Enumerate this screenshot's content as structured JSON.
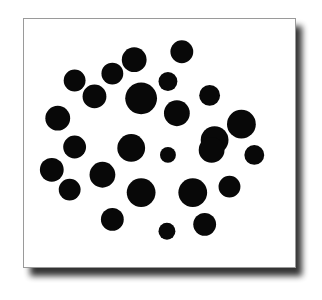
{
  "figure": {
    "title": "",
    "caption": "",
    "background_color": "#ffffff",
    "frame": {
      "border_color": "#9a9a9a",
      "fill_color": "#ffffff",
      "shadow_color": "#000000",
      "x": 23,
      "y": 18,
      "width": 273,
      "height": 250
    }
  },
  "chart_data": {
    "type": "scatter",
    "title": "",
    "xlabel": "",
    "ylabel": "",
    "grid": false,
    "legend": "none",
    "marker": "filled-circle",
    "marker_color": "#080808",
    "xlim": [
      23,
      296
    ],
    "ylim": [
      18,
      268
    ],
    "point_count": 29,
    "series": [
      {
        "name": "points",
        "color": "#080808",
        "points": [
          {
            "x": 134,
            "y": 59,
            "r": 12.5
          },
          {
            "x": 182,
            "y": 51,
            "r": 11.5
          },
          {
            "x": 112,
            "y": 73,
            "r": 11.0
          },
          {
            "x": 74,
            "y": 80,
            "r": 11.0
          },
          {
            "x": 168,
            "y": 81,
            "r": 9.5
          },
          {
            "x": 94,
            "y": 96,
            "r": 12.0
          },
          {
            "x": 141,
            "y": 98,
            "r": 16.0
          },
          {
            "x": 210,
            "y": 95,
            "r": 10.5
          },
          {
            "x": 57,
            "y": 118,
            "r": 12.5
          },
          {
            "x": 177,
            "y": 113,
            "r": 13.0
          },
          {
            "x": 242,
            "y": 124,
            "r": 14.5
          },
          {
            "x": 74,
            "y": 147,
            "r": 11.5
          },
          {
            "x": 131,
            "y": 148,
            "r": 14.0
          },
          {
            "x": 215,
            "y": 140,
            "r": 14.0
          },
          {
            "x": 168,
            "y": 155,
            "r": 8.0
          },
          {
            "x": 255,
            "y": 155,
            "r": 10.0
          },
          {
            "x": 51,
            "y": 170,
            "r": 12.0
          },
          {
            "x": 102,
            "y": 175,
            "r": 13.0
          },
          {
            "x": 69,
            "y": 190,
            "r": 11.0
          },
          {
            "x": 141,
            "y": 193,
            "r": 14.5
          },
          {
            "x": 193,
            "y": 193,
            "r": 14.5
          },
          {
            "x": 230,
            "y": 187,
            "r": 11.0
          },
          {
            "x": 112,
            "y": 220,
            "r": 11.5
          },
          {
            "x": 205,
            "y": 225,
            "r": 11.5
          },
          {
            "x": 167,
            "y": 232,
            "r": 8.5
          },
          {
            "x": 212,
            "y": 150,
            "r": 13.0
          },
          {
            "x": 89,
            "y": 162,
            "r": 0.0
          },
          {
            "x": 155,
            "y": 120,
            "r": 0.0
          },
          {
            "x": 120,
            "y": 130,
            "r": 0.0
          }
        ]
      }
    ]
  }
}
